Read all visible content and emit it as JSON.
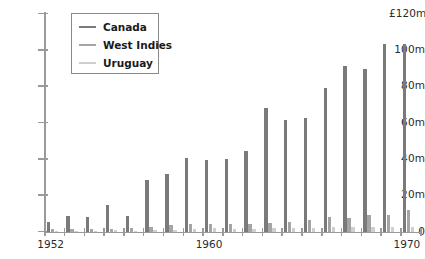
{
  "chart_data": {
    "type": "bar",
    "title": "",
    "subtitle": "",
    "xlabel": "",
    "ylabel": "",
    "y_axis_unit_label": "£120m",
    "categories": [
      1952,
      1953,
      1954,
      1955,
      1956,
      1957,
      1958,
      1959,
      1960,
      1961,
      1962,
      1963,
      1964,
      1965,
      1966,
      1967,
      1968,
      1969,
      1970
    ],
    "x_tick_labels": [
      "1952",
      "1960",
      "1970"
    ],
    "x_tick_values": [
      1952,
      1960,
      1970
    ],
    "y_ticks": [
      0,
      20,
      40,
      60,
      80,
      100,
      120
    ],
    "y_tick_labels": [
      "0",
      "20m",
      "40m",
      "60m",
      "80m",
      "100m",
      "£120m"
    ],
    "ylim": [
      0,
      120
    ],
    "grid": false,
    "legend_position": "top-left-inside",
    "series": [
      {
        "name": "Canada",
        "color": "#7a7a7a",
        "values": [
          5.5,
          9.0,
          8.0,
          15.0,
          9.0,
          28.5,
          32.0,
          41.0,
          39.5,
          40.0,
          44.5,
          68.5,
          61.5,
          63.0,
          79.0,
          91.5,
          90.0,
          103.5,
          103.5
        ]
      },
      {
        "name": "West Indies",
        "color": "#a5a5a5",
        "values": [
          1.5,
          1.5,
          1.5,
          1.5,
          2.0,
          2.5,
          4.0,
          4.5,
          4.5,
          4.5,
          4.5,
          5.0,
          5.5,
          6.5,
          8.0,
          7.5,
          9.5,
          9.5,
          12.0
        ]
      },
      {
        "name": "Uruguay",
        "color": "#cfcfcf",
        "values": [
          0.8,
          0.8,
          0.8,
          1.0,
          0.8,
          1.0,
          1.2,
          1.5,
          2.0,
          1.8,
          1.8,
          2.0,
          2.0,
          2.2,
          2.5,
          2.5,
          3.0,
          3.0,
          3.0
        ]
      }
    ]
  },
  "legend": {
    "items": [
      {
        "label": "Canada",
        "color": "#7a7a7a"
      },
      {
        "label": "West Indies",
        "color": "#a5a5a5"
      },
      {
        "label": "Uruguay",
        "color": "#cfcfcf"
      }
    ]
  },
  "axis_colors": {
    "axis_line": "#9a9a9a",
    "text": "#2b2b2b"
  }
}
